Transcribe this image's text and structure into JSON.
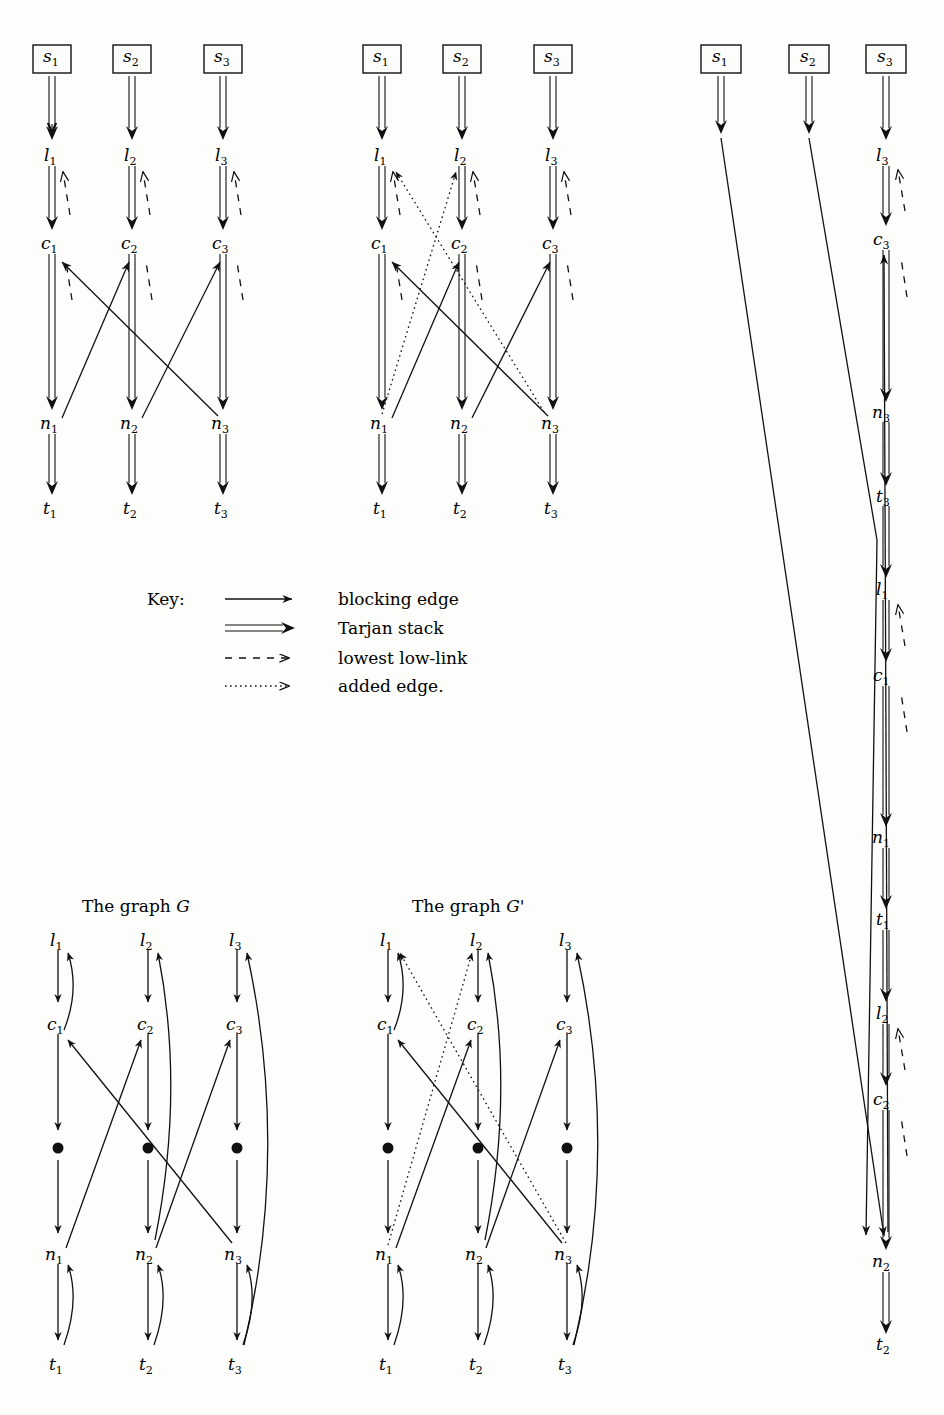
{
  "figure": {
    "kind": "graph-algorithm-diagram",
    "key": {
      "label": "Key:",
      "entries": [
        {
          "style": "solid-arrow",
          "text": "blocking edge"
        },
        {
          "style": "double-arrow",
          "text": "Tarjan stack"
        },
        {
          "style": "dashed-arrow",
          "text": "lowest low-link"
        },
        {
          "style": "dotted-arrow",
          "text": "added edge."
        }
      ]
    },
    "panels": [
      {
        "id": "top-left",
        "name": "search-forest-before",
        "rows": [
          "s",
          "l",
          "c",
          "n",
          "t"
        ],
        "columns": [
          1,
          2,
          3
        ],
        "source_boxes": [
          "s1",
          "s2",
          "s3"
        ],
        "nodes": [
          "l1",
          "l2",
          "l3",
          "c1",
          "c2",
          "c3",
          "n1",
          "n2",
          "n3",
          "t1",
          "t2",
          "t3"
        ],
        "stack_edges": [
          [
            "s1",
            "l1"
          ],
          [
            "s2",
            "l2"
          ],
          [
            "s3",
            "l3"
          ],
          [
            "l1",
            "c1"
          ],
          [
            "l2",
            "c2"
          ],
          [
            "l3",
            "c3"
          ],
          [
            "c1",
            "n1"
          ],
          [
            "c2",
            "n2"
          ],
          [
            "c3",
            "n3"
          ],
          [
            "n1",
            "t1"
          ],
          [
            "n2",
            "t2"
          ],
          [
            "n3",
            "t3"
          ]
        ],
        "lowlink_edges": [
          [
            "c1",
            "l1"
          ],
          [
            "c2",
            "l2"
          ],
          [
            "c3",
            "l3"
          ]
        ],
        "blocking_edges": [
          [
            "n1",
            "c2"
          ],
          [
            "n2",
            "c3"
          ],
          [
            "n3",
            "c1"
          ]
        ]
      },
      {
        "id": "top-middle",
        "name": "search-forest-after",
        "rows": [
          "s",
          "l",
          "c",
          "n",
          "t"
        ],
        "columns": [
          1,
          2,
          3
        ],
        "source_boxes": [
          "s1",
          "s2",
          "s3"
        ],
        "nodes": [
          "l1",
          "l2",
          "l3",
          "c1",
          "c2",
          "c3",
          "n1",
          "n2",
          "n3",
          "t1",
          "t2",
          "t3"
        ],
        "stack_edges": [
          [
            "s1",
            "l1"
          ],
          [
            "s2",
            "l2"
          ],
          [
            "s3",
            "l3"
          ],
          [
            "l1",
            "c1"
          ],
          [
            "l2",
            "c2"
          ],
          [
            "l3",
            "c3"
          ],
          [
            "c1",
            "n1"
          ],
          [
            "c2",
            "n2"
          ],
          [
            "c3",
            "n3"
          ],
          [
            "n1",
            "t1"
          ],
          [
            "n2",
            "t2"
          ],
          [
            "n3",
            "t3"
          ]
        ],
        "lowlink_edges": [
          [
            "c1",
            "l1"
          ],
          [
            "c2",
            "l2"
          ],
          [
            "c3",
            "l3"
          ]
        ],
        "blocking_edges": [
          [
            "n1",
            "c2"
          ],
          [
            "n2",
            "c3"
          ],
          [
            "n3",
            "c1"
          ]
        ],
        "added_edges": [
          [
            "n1",
            "l2"
          ],
          [
            "n3",
            "l1"
          ]
        ]
      },
      {
        "id": "right-column",
        "name": "tarjan-stack-trace",
        "source_boxes": [
          "s1",
          "s2",
          "s3"
        ],
        "chain": [
          "s3",
          "l3",
          "c3",
          "n3",
          "t3",
          "l1",
          "c1",
          "n1",
          "t1",
          "l2",
          "c2",
          "n2",
          "t2"
        ],
        "lowlink_edges": [
          [
            "c3",
            "l3"
          ],
          [
            "c1",
            "l1"
          ],
          [
            "c2",
            "l2"
          ]
        ],
        "long_edges": [
          {
            "from": "s1",
            "to": "n2",
            "style": "blocking edge"
          },
          {
            "from": "s2",
            "to": "t3-region",
            "style": "blocking edge"
          },
          {
            "from": "n2",
            "to": "c3",
            "style": "blocking edge"
          }
        ]
      },
      {
        "id": "bottom-left",
        "name": "graph-G",
        "title": "The graph G",
        "title_plain": "The graph ",
        "title_italic": "G",
        "rows": [
          "l",
          "c",
          "dot",
          "n",
          "t"
        ],
        "columns": [
          1,
          2,
          3
        ],
        "nodes": [
          "l1",
          "l2",
          "l3",
          "c1",
          "c2",
          "c3",
          "n1",
          "n2",
          "n3",
          "t1",
          "t2",
          "t3"
        ],
        "down_edges": [
          [
            "l1",
            "c1"
          ],
          [
            "l2",
            "c2"
          ],
          [
            "l3",
            "c3"
          ],
          [
            "c1",
            "dot1"
          ],
          [
            "c2",
            "dot2"
          ],
          [
            "c3",
            "dot3"
          ],
          [
            "dot1",
            "n1"
          ],
          [
            "dot2",
            "n2"
          ],
          [
            "dot3",
            "n3"
          ],
          [
            "n1",
            "t1"
          ],
          [
            "n2",
            "t2"
          ],
          [
            "n3",
            "t3"
          ]
        ],
        "back_edges": [
          [
            "c1",
            "l1"
          ],
          [
            "n2",
            "l2"
          ],
          [
            "t3",
            "l3"
          ],
          [
            "t1",
            "n1"
          ],
          [
            "t2",
            "n2"
          ],
          [
            "t3",
            "n3"
          ]
        ],
        "cross_edges": [
          [
            "n1",
            "c2"
          ],
          [
            "n2",
            "c3"
          ],
          [
            "n3",
            "c1"
          ]
        ]
      },
      {
        "id": "bottom-middle",
        "name": "graph-G-prime",
        "title": "The graph G'",
        "title_plain": "The graph ",
        "title_italic": "G'",
        "rows": [
          "l",
          "c",
          "dot",
          "n",
          "t"
        ],
        "columns": [
          1,
          2,
          3
        ],
        "nodes": [
          "l1",
          "l2",
          "l3",
          "c1",
          "c2",
          "c3",
          "n1",
          "n2",
          "n3",
          "t1",
          "t2",
          "t3"
        ],
        "down_edges": [
          [
            "l1",
            "c1"
          ],
          [
            "l2",
            "c2"
          ],
          [
            "l3",
            "c3"
          ],
          [
            "c1",
            "dot1"
          ],
          [
            "c2",
            "dot2"
          ],
          [
            "c3",
            "dot3"
          ],
          [
            "dot1",
            "n1"
          ],
          [
            "dot2",
            "n2"
          ],
          [
            "dot3",
            "n3"
          ],
          [
            "n1",
            "t1"
          ],
          [
            "n2",
            "t2"
          ],
          [
            "n3",
            "t3"
          ]
        ],
        "back_edges": [
          [
            "c1",
            "l1"
          ],
          [
            "n2",
            "l2"
          ],
          [
            "t3",
            "l3"
          ],
          [
            "t1",
            "n1"
          ],
          [
            "t2",
            "n2"
          ],
          [
            "t3",
            "n3"
          ]
        ],
        "cross_edges": [
          [
            "n1",
            "c2"
          ],
          [
            "n2",
            "c3"
          ],
          [
            "n3",
            "c1"
          ]
        ],
        "added_edges": [
          [
            "n1",
            "l2"
          ],
          [
            "n3",
            "l1"
          ]
        ]
      }
    ],
    "labels": {
      "s1": "s",
      "s2": "s",
      "s3": "s",
      "l": "l",
      "c": "c",
      "n": "n",
      "t": "t",
      "sub1": "1",
      "sub2": "2",
      "sub3": "3"
    },
    "colors": {
      "ink": "#111111",
      "paper": "#fdfdfb"
    }
  }
}
